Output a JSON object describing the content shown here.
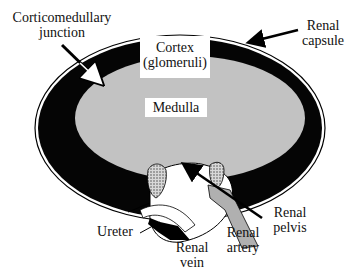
{
  "diagram": {
    "colors": {
      "cortex": "#050505",
      "medulla": "#c2c2c2",
      "capsule": "#ffffff",
      "artery": "#b0b0b0",
      "vessel_stipple": "#8a8a8a",
      "background": "#ffffff"
    },
    "labels": {
      "corticomedullary_junction": [
        "Corticomedullary",
        "junction"
      ],
      "renal_capsule": [
        "Renal",
        "capsule"
      ],
      "cortex": [
        "Cortex",
        "(glomeruli)"
      ],
      "medulla": "Medulla",
      "ureter": "Ureter",
      "renal_vein": [
        "Renal",
        "vein"
      ],
      "renal_artery": [
        "Renal",
        "artery"
      ],
      "renal_pelvis": [
        "Renal",
        "pelvis"
      ]
    }
  }
}
